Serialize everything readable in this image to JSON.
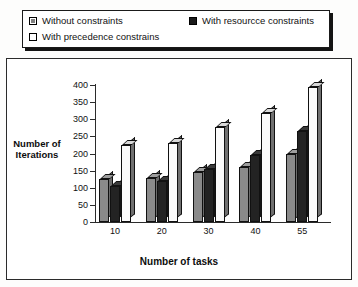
{
  "legend": {
    "items": [
      {
        "label": "Without constraints",
        "swatch": "gray-square-icon",
        "color": "#8a8a8a"
      },
      {
        "label": "With resourcce constraints",
        "swatch": "black-square-icon",
        "color": "#232323"
      },
      {
        "label": "With precedence constrains",
        "swatch": "white-square-icon",
        "color": "#fbfbfb"
      }
    ]
  },
  "chart_data": {
    "type": "bar",
    "title": "",
    "subtitle": "",
    "xlabel": "Number of tasks",
    "ylabel": "Number of Iterations",
    "categories": [
      "10",
      "20",
      "30",
      "40",
      "55"
    ],
    "series": [
      {
        "name": "Without constraints",
        "values": [
          125,
          128,
          145,
          160,
          200
        ]
      },
      {
        "name": "With resourcce constraints",
        "values": [
          105,
          120,
          155,
          195,
          265
        ]
      },
      {
        "name": "With precedence constrains",
        "values": [
          225,
          230,
          278,
          318,
          395
        ]
      }
    ],
    "ylim": [
      0,
      400
    ],
    "yticks": [
      0,
      50,
      100,
      150,
      200,
      250,
      300,
      350,
      400
    ],
    "ytick_labels": [
      "0",
      "50",
      "100",
      "150",
      "200",
      "250",
      "300",
      "350",
      "400"
    ],
    "grid": false,
    "legend_position": "top",
    "style": "3d-column"
  }
}
